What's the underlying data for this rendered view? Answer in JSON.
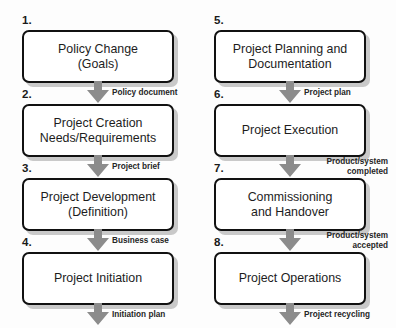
{
  "diagram": {
    "arrow_color": "#8c8c8c",
    "box_border_color": "#111111",
    "box_fill_color": "#ffffff",
    "text_color": "#1d1d1d",
    "background_color": "#fdfdfd"
  },
  "columns": [
    {
      "name": "left-column",
      "stages": [
        {
          "number": "1.",
          "label": "Policy Change\n(Goals)",
          "deliverable": "Policy document",
          "deliverable_lines": 1
        },
        {
          "number": "2.",
          "label": "Project Creation\nNeeds/Requirements",
          "deliverable": "Project brief",
          "deliverable_lines": 1
        },
        {
          "number": "3.",
          "label": "Project Development\n(Definition)",
          "deliverable": "Business case",
          "deliverable_lines": 1
        },
        {
          "number": "4.",
          "label": "Project Initiation",
          "deliverable": "Initiation plan",
          "deliverable_lines": 1
        }
      ]
    },
    {
      "name": "right-column",
      "stages": [
        {
          "number": "5.",
          "label": "Project Planning and\nDocumentation",
          "deliverable": "Project plan",
          "deliverable_lines": 1
        },
        {
          "number": "6.",
          "label": "Project Execution",
          "deliverable": "Product/system\ncompleted",
          "deliverable_lines": 2
        },
        {
          "number": "7.",
          "label": "Commissioning\nand Handover",
          "deliverable": "Product/system\naccepted",
          "deliverable_lines": 2
        },
        {
          "number": "8.",
          "label": "Project Operations",
          "deliverable": "Project recycling",
          "deliverable_lines": 1
        }
      ]
    }
  ]
}
